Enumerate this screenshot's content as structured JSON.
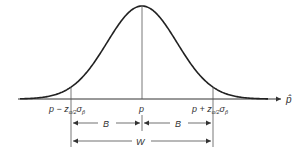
{
  "diagram": {
    "type": "normal-distribution-confidence-interval",
    "axis_label": "p̂",
    "labels": {
      "left_bound": "p − z",
      "left_sub": "α/2",
      "left_sigma": "σ",
      "left_sigma_sub": "p̂",
      "center": "p",
      "right_bound": "p + z",
      "right_sub": "α/2",
      "right_sigma": "σ",
      "right_sigma_sub": "p̂",
      "half_width_left": "B",
      "half_width_right": "B",
      "full_width": "W"
    },
    "colors": {
      "line": "#333333",
      "curve": "#222222"
    }
  }
}
